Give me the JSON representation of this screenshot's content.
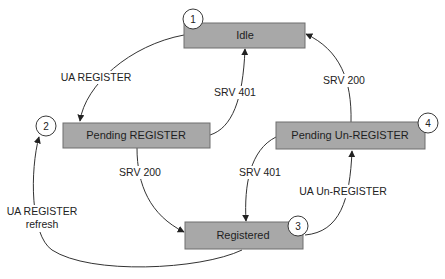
{
  "diagram": {
    "type": "state-machine",
    "colors": {
      "box_fill": "#a8a8a8",
      "box_stroke": "#6e6e6e",
      "line": "#333333",
      "background": "#ffffff"
    },
    "states": [
      {
        "id": "idle",
        "number": "1",
        "label": "Idle"
      },
      {
        "id": "pending-register",
        "number": "2",
        "label": "Pending REGISTER"
      },
      {
        "id": "registered",
        "number": "3",
        "label": "Registered"
      },
      {
        "id": "pending-unregister",
        "number": "4",
        "label": "Pending Un-REGISTER"
      }
    ],
    "transitions": [
      {
        "from": "idle",
        "to": "pending-register",
        "label": "UA REGISTER"
      },
      {
        "from": "pending-register",
        "to": "idle",
        "label": "SRV 401"
      },
      {
        "from": "pending-register",
        "to": "registered",
        "label": "SRV 200"
      },
      {
        "from": "registered",
        "to": "pending-register",
        "label_line1": "UA REGISTER",
        "label_line2": "refresh"
      },
      {
        "from": "registered",
        "to": "pending-unregister",
        "label": "UA Un-REGISTER"
      },
      {
        "from": "pending-unregister",
        "to": "registered",
        "label": "SRV 401"
      },
      {
        "from": "pending-unregister",
        "to": "idle",
        "label": "SRV 200"
      }
    ]
  }
}
